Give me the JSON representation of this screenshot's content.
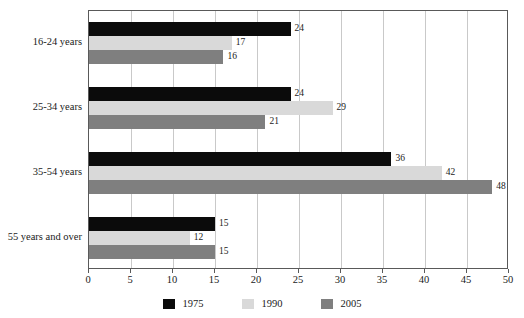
{
  "chart_data": {
    "type": "bar",
    "orientation": "horizontal",
    "title": "",
    "subtitle": "",
    "xlabel": "",
    "ylabel": "",
    "xlim": [
      0,
      50
    ],
    "xticks": [
      0,
      5,
      10,
      15,
      20,
      25,
      30,
      35,
      40,
      45,
      50
    ],
    "xtick_labels": [
      "0",
      "5",
      "10",
      "15",
      "20",
      "25",
      "30",
      "35",
      "40",
      "45",
      "50"
    ],
    "grid": true,
    "grid_axis": "x",
    "legend_position": "bottom",
    "categories": [
      "16-24 years",
      "25-34 years",
      "35-54 years",
      "55 years and over"
    ],
    "series": [
      {
        "name": "1975",
        "color": "#0b0b0b",
        "values": [
          24,
          24,
          36,
          15
        ]
      },
      {
        "name": "1990",
        "color": "#d9d9d9",
        "values": [
          17,
          29,
          42,
          12
        ]
      },
      {
        "name": "2005",
        "color": "#7f7f7f",
        "values": [
          16,
          21,
          48,
          15
        ]
      }
    ],
    "data_labels": [
      [
        "24",
        "17",
        "16"
      ],
      [
        "24",
        "29",
        "21"
      ],
      [
        "36",
        "42",
        "48"
      ],
      [
        "15",
        "12",
        "15"
      ]
    ]
  }
}
